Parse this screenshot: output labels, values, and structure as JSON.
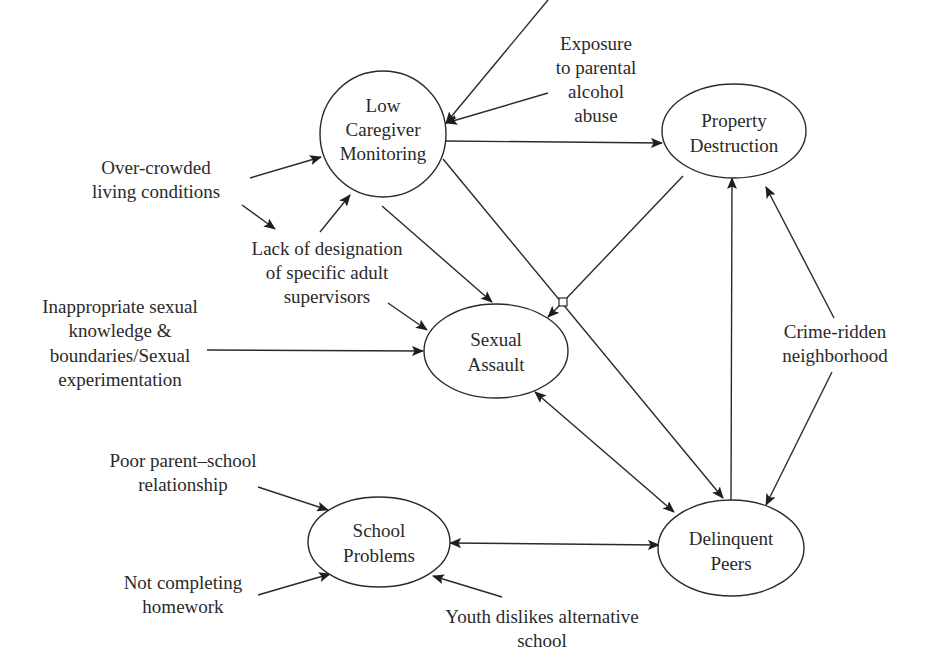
{
  "diagram": {
    "colors": {
      "stroke": "#2a2a2a",
      "background": "#ffffff"
    },
    "nodes": {
      "low_caregiver": {
        "lines": [
          "Low",
          "Caregiver",
          "Monitoring"
        ]
      },
      "property_destruction": {
        "lines": [
          "Property",
          "Destruction"
        ]
      },
      "sexual_assault": {
        "lines": [
          "Sexual",
          "Assault"
        ]
      },
      "school_problems": {
        "lines": [
          "School",
          "Problems"
        ]
      },
      "delinquent_peers": {
        "lines": [
          "Delinquent",
          "Peers"
        ]
      }
    },
    "factors": {
      "parental_alcohol": {
        "lines": [
          "Exposure",
          "to parental",
          "alcohol",
          "abuse"
        ]
      },
      "overcrowded": {
        "lines": [
          "Over-crowded",
          "living conditions"
        ]
      },
      "lack_supervisors": {
        "lines": [
          "Lack of designation",
          "of specific adult",
          "supervisors"
        ]
      },
      "sexual_knowledge": {
        "lines": [
          "Inappropriate sexual",
          "knowledge &",
          "boundaries/Sexual",
          "experimentation"
        ]
      },
      "crime_neighborhood": {
        "lines": [
          "Crime-ridden",
          "neighborhood"
        ]
      },
      "parent_school": {
        "lines": [
          "Poor parent–school",
          "relationship"
        ]
      },
      "homework": {
        "lines": [
          "Not completing",
          "homework"
        ]
      },
      "alt_school": {
        "lines": [
          "Youth dislikes alternative",
          "school"
        ]
      }
    },
    "edges": [
      {
        "from": "Exposure to parental alcohol abuse",
        "to": "Low Caregiver Monitoring",
        "type": "directed"
      },
      {
        "from": "Over-crowded living conditions",
        "to": "Low Caregiver Monitoring",
        "type": "directed"
      },
      {
        "from": "Over-crowded living conditions",
        "to": "Lack of designation of specific adult supervisors",
        "type": "directed"
      },
      {
        "from": "Lack of designation of specific adult supervisors",
        "to": "Low Caregiver Monitoring",
        "type": "directed"
      },
      {
        "from": "Lack of designation of specific adult supervisors",
        "to": "Sexual Assault",
        "type": "directed"
      },
      {
        "from": "Low Caregiver Monitoring",
        "to": "Property Destruction",
        "type": "directed"
      },
      {
        "from": "Low Caregiver Monitoring",
        "to": "Sexual Assault",
        "type": "directed"
      },
      {
        "from": "Low Caregiver Monitoring",
        "to": "Delinquent Peers",
        "type": "directed",
        "via": "junction"
      },
      {
        "from": "Property Destruction",
        "to": "Sexual Assault",
        "type": "directed",
        "via": "junction"
      },
      {
        "from": "Inappropriate sexual knowledge & boundaries/Sexual experimentation",
        "to": "Sexual Assault",
        "type": "directed"
      },
      {
        "from": "Sexual Assault",
        "to": "Delinquent Peers",
        "type": "bidirectional"
      },
      {
        "from": "Delinquent Peers",
        "to": "Property Destruction",
        "type": "directed"
      },
      {
        "from": "Crime-ridden neighborhood",
        "to": "Property Destruction",
        "type": "directed"
      },
      {
        "from": "Crime-ridden neighborhood",
        "to": "Delinquent Peers",
        "type": "directed"
      },
      {
        "from": "Poor parent–school relationship",
        "to": "School Problems",
        "type": "directed"
      },
      {
        "from": "Not completing homework",
        "to": "School Problems",
        "type": "directed"
      },
      {
        "from": "Youth dislikes alternative school",
        "to": "School Problems",
        "type": "directed"
      },
      {
        "from": "School Problems",
        "to": "Delinquent Peers",
        "type": "bidirectional"
      }
    ]
  }
}
